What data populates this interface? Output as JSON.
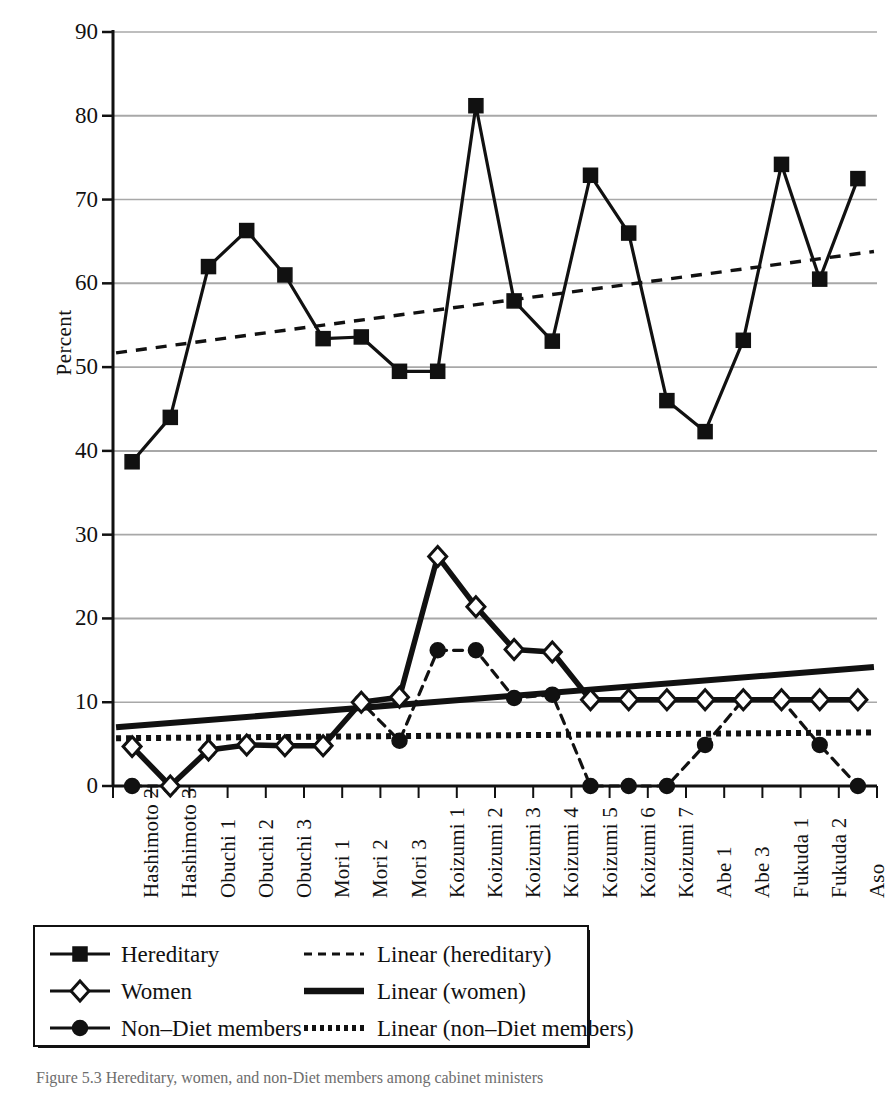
{
  "figure": {
    "caption": "Figure 5.3  Hereditary, women, and non-Diet members among cabinet ministers"
  },
  "axes": {
    "y_title": "Percent",
    "y_ticks": [
      0,
      10,
      20,
      30,
      40,
      50,
      60,
      70,
      80,
      90
    ],
    "y_tick_labels": [
      "0",
      "10",
      "20",
      "30",
      "40",
      "50",
      "60",
      "70",
      "80",
      "90"
    ]
  },
  "legend": {
    "rows": [
      {
        "left_label": "Hereditary",
        "left_marker": "filled-square-marker",
        "left_style": "solid-line",
        "right_label": "Linear (hereditary)",
        "right_style": "dashed-line"
      },
      {
        "left_label": "Women",
        "left_marker": "open-diamond-marker",
        "left_style": "solid-line",
        "right_label": "Linear (women)",
        "right_style": "thick-solid-line"
      },
      {
        "left_label": "Non–Diet members",
        "left_marker": "filled-circle-marker",
        "left_style": "solid-line",
        "right_label": "Linear (non–Diet members)",
        "right_style": "dotted-line"
      }
    ]
  },
  "colors": {
    "ink": "#111111",
    "gridline": "#9a9a9a",
    "background": "#ffffff"
  },
  "chart_data": {
    "type": "line",
    "title": "",
    "xlabel": "",
    "ylabel": "Percent",
    "ylim": [
      0,
      90
    ],
    "grid": true,
    "legend_position": "bottom",
    "categories": [
      "Hashimoto 2",
      "Hashimoto 3",
      "Obuchi 1",
      "Obuchi 2",
      "Obuchi 3",
      "Mori 1",
      "Mori 2",
      "Mori 3",
      "Koizumi 1",
      "Koizumi 2",
      "Koizumi 3",
      "Koizumi 4",
      "Koizumi 5",
      "Koizumi 6",
      "Koizumi 7",
      "Abe 1",
      "Abe 3",
      "Fukuda 1",
      "Fukuda 2",
      "Aso"
    ],
    "series": [
      {
        "name": "Hereditary",
        "marker": "filled-square",
        "style": "solid",
        "values": [
          38.7,
          44.0,
          62.0,
          66.3,
          61.0,
          53.4,
          53.6,
          49.5,
          49.5,
          81.2,
          57.9,
          53.1,
          72.9,
          66.0,
          46.0,
          42.3,
          53.2,
          74.2,
          60.5,
          72.5
        ]
      },
      {
        "name": "Women",
        "marker": "open-diamond",
        "style": "solid",
        "values": [
          4.7,
          0.0,
          4.3,
          4.9,
          4.8,
          4.8,
          10.0,
          10.6,
          27.4,
          21.4,
          16.3,
          16.0,
          10.3,
          10.3,
          10.3,
          10.3,
          10.3,
          10.3,
          10.3,
          10.3
        ]
      },
      {
        "name": "Non–Diet members",
        "marker": "filled-circle",
        "style": "dashed",
        "values": [
          0.0,
          0.0,
          4.3,
          4.9,
          4.8,
          4.8,
          10.0,
          5.4,
          16.2,
          16.2,
          10.5,
          10.9,
          0.0,
          0.0,
          0.0,
          4.9,
          10.3,
          10.3,
          4.9,
          0.0
        ]
      }
    ],
    "trendlines": [
      {
        "name": "Linear (hereditary)",
        "style": "dashed",
        "y_start": 51.7,
        "y_end": 63.8
      },
      {
        "name": "Linear (women)",
        "style": "thick-solid",
        "y_start": 7.0,
        "y_end": 14.2
      },
      {
        "name": "Linear (non–Diet members)",
        "style": "dotted",
        "y_start": 5.7,
        "y_end": 6.4
      }
    ]
  }
}
